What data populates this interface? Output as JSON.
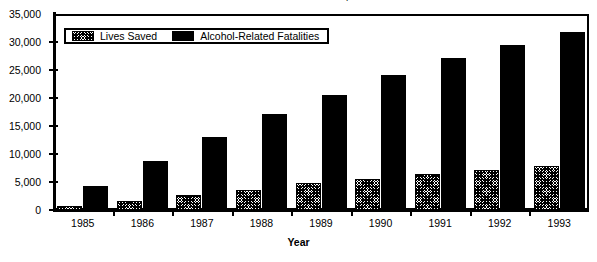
{
  "chart_data": {
    "type": "bar",
    "title": "Lives Saved and Alcohol Fatalities, Baseline 1981",
    "xlabel": "Year",
    "ylabel": "",
    "categories": [
      "1985",
      "1986",
      "1987",
      "1988",
      "1989",
      "1990",
      "1991",
      "1992",
      "1993"
    ],
    "series": [
      {
        "name": "Lives Saved",
        "pattern": "hatch",
        "color": "#ffffff",
        "values": [
          800,
          1600,
          2600,
          3500,
          4800,
          5500,
          6400,
          7100,
          7800
        ]
      },
      {
        "name": "Alcohol-Related Fatalities",
        "pattern": "solid",
        "color": "#000000",
        "values": [
          4300,
          8800,
          13000,
          17100,
          20500,
          24100,
          27200,
          29500,
          31700
        ]
      }
    ],
    "ylim": [
      0,
      35000
    ],
    "ytick_values": [
      0,
      5000,
      10000,
      15000,
      20000,
      25000,
      30000,
      35000
    ],
    "ytick_labels": [
      "0",
      "5,000",
      "10,000",
      "15,000",
      "20,000",
      "25,000",
      "30,000",
      "35,000"
    ],
    "grid": false,
    "legend_position": "top-left-inside"
  }
}
